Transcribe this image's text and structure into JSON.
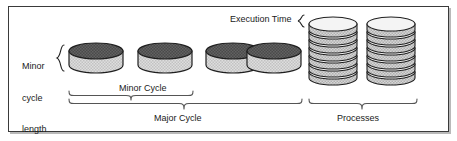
{
  "figure": {
    "background": "#ffffff",
    "frame_color": "#3a3a3a",
    "text_color": "#1a1a1a"
  },
  "labels": {
    "minor_cycle_length_line1": "Minor",
    "minor_cycle_length_line2": "cycle",
    "minor_cycle_length_line3": "length",
    "minor_cycle": "Minor Cycle",
    "major_cycle": "Major Cycle",
    "execution_time": "Execution Time",
    "processes": "Processes"
  },
  "diagram_data": {
    "type": "diagram",
    "minor_cycle_count": 4,
    "process_stack_count": 2,
    "discs_per_stack": 7,
    "cylinder_top_fill": "#4f4f4f",
    "cylinder_body_fill": "#d2d2d2",
    "disc_top_fill": "#f2f2f2",
    "disc_body_fill": "#c9c9c9",
    "outline_color": "#1f1f1f"
  }
}
